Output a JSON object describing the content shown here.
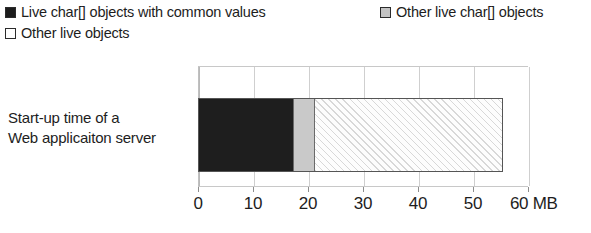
{
  "chart_data": {
    "type": "bar",
    "orientation": "horizontal",
    "stacked": true,
    "title": "",
    "xlabel": "",
    "ylabel": "",
    "unit": "MB",
    "xlim": [
      0,
      60
    ],
    "xticks": [
      0,
      10,
      20,
      30,
      40,
      50,
      60
    ],
    "xtick_labels": [
      "0",
      "10",
      "20",
      "30",
      "40",
      "50",
      "60 MB"
    ],
    "grid": true,
    "legend_position": "top",
    "categories": [
      "Start-up time of a Web applicaiton server"
    ],
    "series": [
      {
        "name": "Live char[] objects with common values",
        "values": [
          17
        ],
        "color": "#1e1e1e",
        "fill": "solid"
      },
      {
        "name": "Other live char[] objects",
        "values": [
          4
        ],
        "color": "#c9c9c9",
        "fill": "solid"
      },
      {
        "name": "Other live objects",
        "values": [
          34
        ],
        "color": "#fdfdfd",
        "fill": "diagonal-hatch"
      }
    ],
    "segment_cumulative": [
      17,
      21,
      55
    ],
    "total": 55
  },
  "legend": {
    "items": [
      {
        "label": "Live char[] objects with common values",
        "swatch": "filled-black-square"
      },
      {
        "label": "Other live char[] objects",
        "swatch": "filled-gray-square"
      },
      {
        "label": "Other live objects",
        "swatch": "empty-white-square"
      }
    ]
  },
  "axis": {
    "ticks": [
      {
        "label": "0",
        "value": 0
      },
      {
        "label": "10",
        "value": 10
      },
      {
        "label": "20",
        "value": 20
      },
      {
        "label": "30",
        "value": 30
      },
      {
        "label": "40",
        "value": 40
      },
      {
        "label": "50",
        "value": 50
      },
      {
        "label": "60 MB",
        "value": 60
      }
    ]
  },
  "category": {
    "line1": "Start-up time of a",
    "line2": "Web applicaiton server"
  }
}
